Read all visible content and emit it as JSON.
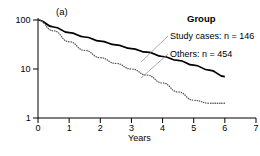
{
  "panel": {
    "label": "(a)"
  },
  "legend": {
    "title": "Group",
    "rows": [
      {
        "label": "Study cases: n = 146",
        "style": "dotted",
        "n": 146
      },
      {
        "label": "Others: n = 454",
        "style": "solid",
        "n": 454
      }
    ]
  },
  "axes": {
    "x": {
      "title": "Years",
      "ticks": [
        "0",
        "1",
        "2",
        "3",
        "4",
        "5",
        "6",
        "7"
      ]
    },
    "y": {
      "title": "Survival (log %)",
      "ticks": [
        "1",
        "10",
        "100"
      ]
    }
  },
  "chart_data": {
    "type": "line",
    "title": "(a)",
    "xlabel": "Years",
    "ylabel": "Survival (log %)",
    "xlim": [
      0,
      7
    ],
    "ylim": [
      1,
      100
    ],
    "yscale": "log",
    "grid": false,
    "legend_position": "upper-right",
    "legend_title": "Group",
    "x": [
      0,
      0.5,
      1,
      1.5,
      2,
      2.5,
      3,
      3.5,
      4,
      4.5,
      5,
      5.5,
      6
    ],
    "series": [
      {
        "name": "Others: n = 454",
        "n": 454,
        "style": "solid",
        "color": "#000000",
        "values": [
          100,
          72,
          55,
          45,
          37,
          31,
          26,
          22,
          18,
          15,
          12,
          9.5,
          7
        ]
      },
      {
        "name": "Study cases: n = 146",
        "n": 146,
        "style": "dotted",
        "color": "#555555",
        "values": [
          100,
          60,
          36,
          24,
          17,
          13,
          10,
          7.5,
          5.2,
          3.4,
          2.3,
          2.0,
          2.0
        ]
      }
    ]
  }
}
